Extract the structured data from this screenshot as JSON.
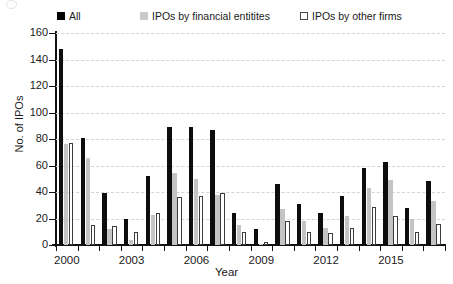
{
  "legend": {
    "items": [
      {
        "label": "All",
        "swatch": "black-filled-square-icon",
        "color": "#0d0d0d"
      },
      {
        "label": "IPOs by financial entitites",
        "swatch": "gray-filled-square-icon",
        "color": "#c4c4c4"
      },
      {
        "label": "IPOs by other firms",
        "swatch": "white-outlined-square-icon",
        "color": "#ffffff"
      }
    ]
  },
  "axes": {
    "y_title": "No. of IPOs",
    "x_title": "Year",
    "y_ticks": [
      "0",
      "20",
      "40",
      "60",
      "80",
      "100",
      "120",
      "140",
      "160"
    ],
    "x_ticks": [
      "2000",
      "2003",
      "2006",
      "2009",
      "2012",
      "2015"
    ]
  },
  "chart_data": {
    "type": "bar",
    "title": "",
    "subtitle": "",
    "xlabel": "Year",
    "ylabel": "No. of IPOs",
    "ylim": [
      0,
      160
    ],
    "ytick_step": 20,
    "grid": true,
    "grid_axis": "y",
    "legend_position": "top",
    "categories": [
      "2000",
      "2001",
      "2002",
      "2003",
      "2004",
      "2005",
      "2006",
      "2007",
      "2008",
      "2009",
      "2010",
      "2011",
      "2012",
      "2013",
      "2014",
      "2015",
      "2016",
      "2017"
    ],
    "labeled_categories": [
      "2000",
      "2003",
      "2006",
      "2009",
      "2012",
      "2015"
    ],
    "series": [
      {
        "name": "All",
        "color": "#0d0d0d",
        "values": [
          148,
          81,
          39,
          20,
          52,
          89,
          89,
          87,
          24,
          12,
          46,
          31,
          24,
          37,
          58,
          63,
          28,
          48
        ]
      },
      {
        "name": "IPOs by financial entitites",
        "color": "#c4c4c4",
        "values": [
          76,
          66,
          12,
          4,
          23,
          54,
          50,
          38,
          15,
          1,
          27,
          18,
          13,
          22,
          43,
          49,
          20,
          33
        ]
      },
      {
        "name": "IPOs by other firms",
        "color": "#ffffff",
        "values": [
          77,
          15,
          14,
          10,
          24,
          36,
          37,
          39,
          10,
          2,
          18,
          10,
          9,
          13,
          29,
          22,
          10,
          16
        ]
      }
    ]
  }
}
